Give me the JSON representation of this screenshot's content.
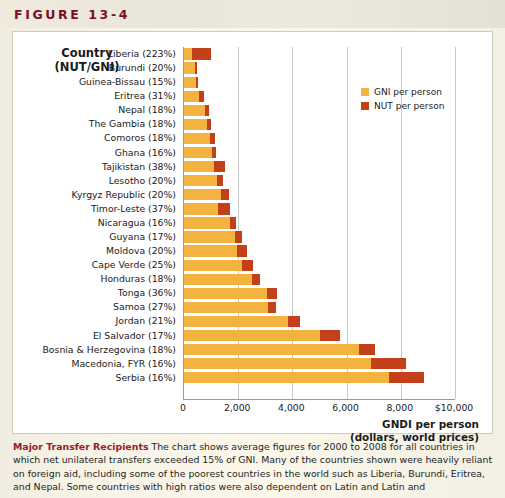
{
  "figure": {
    "label": "FIGURE 13-4"
  },
  "legend": {
    "position": "top-right",
    "items": [
      {
        "label": "GNI per person",
        "color": "#f4b23f",
        "key": "gni"
      },
      {
        "label": "NUT per person",
        "color": "#c3401b",
        "key": "nut"
      }
    ]
  },
  "category_header": {
    "line1": "Country",
    "line2": "(NUT/GNI)"
  },
  "axis_title": {
    "line1": "GNDI per person",
    "line2": "(dollars, world prices)"
  },
  "caption": {
    "lead": "Major Transfer Recipients",
    "body": " The chart shows average figures for 2000 to 2008 for all countries in which net unilateral transfers exceeded 15% of GNI. Many of the countries shown were heavily reliant on foreign aid, including some of the poorest countries in the world such as Liberia, Burundi, Eritrea, and Nepal. Some countries with high ratios were also dependent on Latin and Latin and"
  },
  "chart_data": {
    "type": "bar",
    "orientation": "horizontal",
    "stacked": true,
    "title": "",
    "xlabel": "GNDI per person (dollars, world prices)",
    "ylabel": "Country (NUT/GNI)",
    "xlim": [
      0,
      10000
    ],
    "xticks": [
      0,
      2000,
      4000,
      6000,
      8000,
      10000
    ],
    "xticklabels": [
      "0",
      "2,000",
      "4,000",
      "6,000",
      "8,000",
      "$10,000"
    ],
    "grid": "vertical",
    "colors": {
      "gni": "#f4b23f",
      "nut": "#c3401b"
    },
    "categories": [
      "Liberia (223%)",
      "Burundi (20%)",
      "Guinea-Bissau (15%)",
      "Eritrea (31%)",
      "Nepal (18%)",
      "The Gambia (18%)",
      "Comoros (18%)",
      "Ghana (16%)",
      "Tajikistan (38%)",
      "Lesotho (20%)",
      "Kyrgyz Republic (20%)",
      "Timor-Leste (37%)",
      "Nicaragua (16%)",
      "Guyana (17%)",
      "Moldova (20%)",
      "Cape Verde (25%)",
      "Honduras (18%)",
      "Tonga (36%)",
      "Samoa (27%)",
      "Jordan (21%)",
      "El Salvador (17%)",
      "Bosnia & Herzegovina (18%)",
      "Macedonia, FYR (16%)",
      "Serbia (16%)"
    ],
    "series": [
      {
        "name": "GNI per person",
        "key": "gni",
        "values": [
          310,
          390,
          440,
          560,
          790,
          850,
          960,
          1030,
          1100,
          1200,
          1380,
          1250,
          1700,
          1900,
          1950,
          2150,
          2500,
          3050,
          3100,
          3850,
          5000,
          6450,
          6900,
          7550
        ]
      },
      {
        "name": "NUT per person",
        "key": "nut",
        "values": [
          690,
          80,
          65,
          175,
          145,
          155,
          175,
          165,
          420,
          240,
          275,
          465,
          210,
          240,
          390,
          400,
          300,
          400,
          280,
          430,
          760,
          600,
          1300,
          1300
        ]
      }
    ],
    "totals": [
      1000,
      470,
      505,
      735,
      935,
      1005,
      1135,
      1195,
      1520,
      1440,
      1655,
      1715,
      1910,
      2140,
      2340,
      2550,
      2800,
      3450,
      3380,
      4280,
      5760,
      7050,
      8200,
      8850
    ],
    "nut_gni_ratios_percent": [
      223,
      20,
      15,
      31,
      18,
      18,
      18,
      16,
      38,
      20,
      20,
      37,
      16,
      17,
      20,
      25,
      18,
      36,
      27,
      21,
      17,
      18,
      16,
      16
    ]
  }
}
